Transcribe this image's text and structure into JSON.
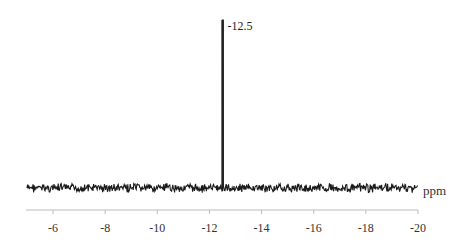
{
  "chart_data": {
    "type": "line",
    "title": "",
    "xlabel": "ppm",
    "ylabel": "",
    "xlim": [
      -5,
      -20
    ],
    "x_ticks": [
      -6,
      -8,
      -10,
      -12,
      -14,
      -16,
      -18,
      -20
    ],
    "tick_labels": [
      "-6",
      "-8",
      "-10",
      "-12",
      "-14",
      "-16",
      "-18",
      "-20"
    ],
    "grid": false,
    "legend": null,
    "series": [
      {
        "name": "spectrum",
        "description": "Noisy baseline with a single sharp peak",
        "peaks": [
          {
            "x": -12.5,
            "relative_height": 1.0,
            "label": "-12.5"
          }
        ]
      }
    ],
    "annotations": [
      {
        "x": -12.5,
        "text": "-12.5"
      }
    ]
  }
}
